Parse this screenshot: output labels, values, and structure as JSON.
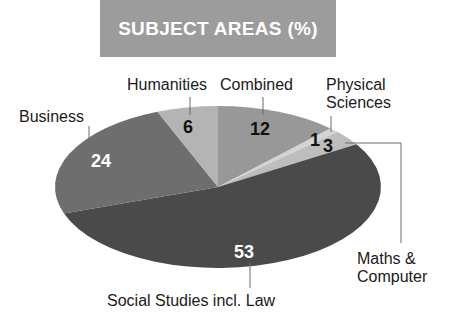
{
  "title": "SUBJECT AREAS (%)",
  "colors": {
    "title_bg": "#9c9c9c",
    "title_text": "#ffffff",
    "combined": "#989898",
    "physical_sciences": "#d4d4d4",
    "maths_computer": "#bdbdbd",
    "social_studies": "#4a4a4a",
    "business": "#6e6e6e",
    "humanities": "#b4b4b4",
    "leader_line": "#6a6a6a"
  },
  "chart_data": {
    "type": "pie",
    "title": "SUBJECT AREAS (%)",
    "start": "top",
    "direction": "clockwise",
    "categories": [
      "Combined",
      "Physical Sciences",
      "Maths & Computer",
      "Social Studies incl. Law",
      "Business",
      "Humanities"
    ],
    "values": [
      12,
      1,
      3,
      53,
      24,
      6
    ],
    "unit": "%",
    "legend": "none (direct labels with leader lines)"
  },
  "labels": {
    "combined": "Combined",
    "physical_line1": "Physical",
    "physical_line2": "Sciences",
    "maths_line1": "Maths &",
    "maths_line2": "Computer",
    "social": "Social Studies incl. Law",
    "business": "Business",
    "humanities": "Humanities"
  },
  "values_text": {
    "combined": "12",
    "physical": "1",
    "maths": "3",
    "social": "53",
    "business": "24",
    "humanities": "6"
  }
}
